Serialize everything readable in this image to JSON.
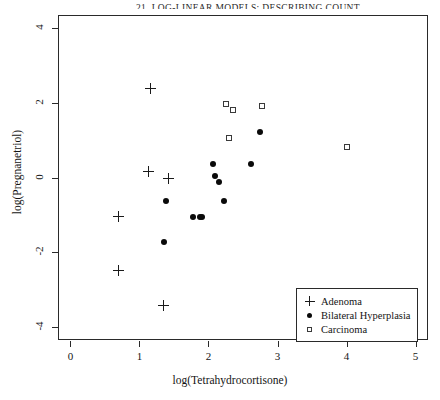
{
  "page": {
    "running_head": "21.  LOG-LINEAR MODELS: DESCRIBING COUNT",
    "background_color": "#ffffff"
  },
  "chart_data": {
    "type": "scatter",
    "title": "",
    "xlabel": "log(Tetrahydrocortisone)",
    "ylabel": "log(Pregnanetriol)",
    "xlim": [
      -0.18,
      5.18
    ],
    "ylim": [
      -4.36,
      4.36
    ],
    "xticks": [
      0,
      1,
      2,
      3,
      4,
      5
    ],
    "xtick_labels": [
      "0",
      "1",
      "2",
      "3",
      "4",
      "5"
    ],
    "yticks": [
      -4,
      -2,
      0,
      2,
      4
    ],
    "ytick_labels": [
      "-4",
      "-2",
      "0",
      "2",
      "4"
    ],
    "grid": false,
    "legend_position": "bottom-right",
    "marker_color": "#0a0a0a",
    "axis_color": "#2a2a2a",
    "series": [
      {
        "name": "Adenoma",
        "marker": "plus",
        "legend_key": "k-plus",
        "points": [
          {
            "x": 1.16,
            "y": 2.39
          },
          {
            "x": 1.13,
            "y": 0.16
          },
          {
            "x": 1.42,
            "y": -0.02
          },
          {
            "x": 0.69,
            "y": -1.05
          },
          {
            "x": 0.69,
            "y": -2.49
          },
          {
            "x": 1.35,
            "y": -3.43
          }
        ]
      },
      {
        "name": "Bilateral Hyperplasia",
        "marker": "dot",
        "legend_key": "k-dot",
        "points": [
          {
            "x": 2.75,
            "y": 1.21
          },
          {
            "x": 2.62,
            "y": 0.35
          },
          {
            "x": 2.06,
            "y": 0.35
          },
          {
            "x": 2.09,
            "y": 0.05
          },
          {
            "x": 2.15,
            "y": -0.11
          },
          {
            "x": 1.39,
            "y": -0.64
          },
          {
            "x": 2.23,
            "y": -0.64
          },
          {
            "x": 1.77,
            "y": -1.07
          },
          {
            "x": 1.88,
            "y": -1.07
          },
          {
            "x": 1.9,
            "y": -1.05
          },
          {
            "x": 1.36,
            "y": -1.74
          }
        ]
      },
      {
        "name": "Carcinoma",
        "marker": "square",
        "legend_key": "k-square",
        "points": [
          {
            "x": 2.25,
            "y": 1.98
          },
          {
            "x": 2.35,
            "y": 1.8
          },
          {
            "x": 2.78,
            "y": 1.93
          },
          {
            "x": 2.29,
            "y": 1.05
          },
          {
            "x": 4.0,
            "y": 0.83
          }
        ]
      }
    ]
  }
}
